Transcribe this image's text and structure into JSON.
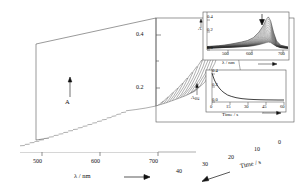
{
  "figure": {
    "kind": "3d-waterfall-absorption-spectra"
  },
  "main_plot": {
    "x_axis": {
      "label": "λ / nm",
      "label_arrow": "⟶",
      "ticks": [
        "500",
        "600",
        "700"
      ],
      "tick_values": [
        500,
        600,
        700
      ],
      "range": [
        460,
        740
      ]
    },
    "y_axis": {
      "label": "A",
      "label_arrow": "↑",
      "ticks": [
        "0.4",
        "0.2"
      ],
      "tick_values": [
        0.4,
        0.2
      ],
      "range": [
        0.0,
        0.47
      ]
    },
    "z_axis": {
      "label": "Time / s",
      "label_arrow": "⟵",
      "ticks": [
        "0",
        "10",
        "20",
        "30",
        "40"
      ],
      "tick_values": [
        0,
        10,
        20,
        30,
        40
      ],
      "range": [
        0,
        44
      ]
    }
  },
  "inset_top": {
    "name": "overlaid-spectra-inset",
    "x_axis": {
      "label": "λ / nm",
      "label_arrow": "⟶",
      "ticks": [
        "500",
        "600",
        "700"
      ],
      "tick_values": [
        500,
        600,
        700
      ]
    },
    "y_axis": {
      "label": "A",
      "ticks": [
        "0.4",
        "0.2",
        "0.0"
      ],
      "tick_values": [
        0.4,
        0.2,
        0.0
      ]
    },
    "annotation": {
      "marker": "down-arrow",
      "at_nm": 672,
      "meaning": "decay direction"
    }
  },
  "inset_bottom": {
    "name": "kinetic-decay-inset",
    "x_axis": {
      "label": "Time / s",
      "label_arrow": "⟶",
      "ticks": [
        "0",
        "15",
        "30",
        "45",
        "60"
      ],
      "tick_values": [
        0,
        15,
        30,
        45,
        60
      ]
    },
    "y_axis": {
      "label_base": "A",
      "label_sub": "604",
      "label_arrow": "↑",
      "ticks": [
        "0.4",
        "0.2",
        "0.0"
      ],
      "tick_values": [
        0.4,
        0.2,
        0.0
      ]
    }
  },
  "colors": {
    "ink": "#1a1a1a",
    "trace": "#333333",
    "axis": "#555555",
    "background": "#ffffff"
  },
  "chart_data": {
    "type": "line",
    "title": "",
    "xlabel": "λ / nm",
    "ylabel": "A",
    "zlabel": "Time / s",
    "xlim": [
      460,
      740
    ],
    "ylim": [
      0.0,
      0.47
    ],
    "zlim": [
      0,
      44
    ],
    "grid": false,
    "legend": "none",
    "x": [
      460,
      480,
      500,
      520,
      540,
      560,
      580,
      600,
      620,
      640,
      655,
      665,
      672,
      680,
      690,
      700,
      715,
      740
    ],
    "series": [
      {
        "name": "t = 0 s",
        "time_s": 0,
        "values": [
          0.045,
          0.05,
          0.056,
          0.064,
          0.076,
          0.09,
          0.105,
          0.124,
          0.16,
          0.235,
          0.32,
          0.4,
          0.432,
          0.38,
          0.23,
          0.12,
          0.062,
          0.04
        ]
      },
      {
        "name": "t = 2 s",
        "time_s": 2,
        "values": [
          0.043,
          0.048,
          0.054,
          0.061,
          0.072,
          0.085,
          0.099,
          0.117,
          0.15,
          0.22,
          0.3,
          0.374,
          0.404,
          0.356,
          0.216,
          0.113,
          0.059,
          0.038
        ]
      },
      {
        "name": "t = 4 s",
        "time_s": 4,
        "values": [
          0.041,
          0.046,
          0.051,
          0.058,
          0.068,
          0.08,
          0.093,
          0.11,
          0.141,
          0.205,
          0.28,
          0.349,
          0.377,
          0.333,
          0.203,
          0.107,
          0.056,
          0.036
        ]
      },
      {
        "name": "t = 6 s",
        "time_s": 6,
        "values": [
          0.039,
          0.044,
          0.049,
          0.055,
          0.065,
          0.076,
          0.088,
          0.103,
          0.132,
          0.192,
          0.261,
          0.325,
          0.351,
          0.311,
          0.19,
          0.101,
          0.053,
          0.035
        ]
      },
      {
        "name": "t = 8 s",
        "time_s": 8,
        "values": [
          0.038,
          0.042,
          0.047,
          0.053,
          0.062,
          0.072,
          0.083,
          0.097,
          0.124,
          0.179,
          0.243,
          0.302,
          0.326,
          0.29,
          0.178,
          0.096,
          0.051,
          0.034
        ]
      },
      {
        "name": "t = 10 s",
        "time_s": 10,
        "values": [
          0.036,
          0.04,
          0.045,
          0.05,
          0.059,
          0.068,
          0.078,
          0.092,
          0.117,
          0.168,
          0.226,
          0.28,
          0.303,
          0.27,
          0.167,
          0.091,
          0.049,
          0.033
        ]
      },
      {
        "name": "t = 12 s",
        "time_s": 12,
        "values": [
          0.035,
          0.039,
          0.043,
          0.048,
          0.056,
          0.065,
          0.074,
          0.087,
          0.11,
          0.157,
          0.211,
          0.26,
          0.281,
          0.251,
          0.157,
          0.086,
          0.047,
          0.032
        ]
      },
      {
        "name": "t = 14 s",
        "time_s": 14,
        "values": [
          0.034,
          0.037,
          0.041,
          0.046,
          0.053,
          0.062,
          0.07,
          0.082,
          0.104,
          0.147,
          0.197,
          0.242,
          0.261,
          0.234,
          0.147,
          0.082,
          0.045,
          0.031
        ]
      },
      {
        "name": "t = 16 s",
        "time_s": 16,
        "values": [
          0.033,
          0.036,
          0.04,
          0.045,
          0.051,
          0.059,
          0.067,
          0.078,
          0.098,
          0.138,
          0.184,
          0.225,
          0.243,
          0.218,
          0.138,
          0.078,
          0.043,
          0.03
        ]
      },
      {
        "name": "t = 18 s",
        "time_s": 18,
        "values": [
          0.032,
          0.035,
          0.039,
          0.043,
          0.049,
          0.057,
          0.064,
          0.074,
          0.093,
          0.13,
          0.172,
          0.209,
          0.226,
          0.204,
          0.13,
          0.074,
          0.042,
          0.029
        ]
      },
      {
        "name": "t = 20 s",
        "time_s": 20,
        "values": [
          0.031,
          0.034,
          0.037,
          0.042,
          0.048,
          0.054,
          0.061,
          0.07,
          0.088,
          0.122,
          0.161,
          0.195,
          0.21,
          0.19,
          0.123,
          0.071,
          0.04,
          0.028
        ]
      },
      {
        "name": "t = 22 s",
        "time_s": 22,
        "values": [
          0.03,
          0.033,
          0.036,
          0.04,
          0.046,
          0.052,
          0.059,
          0.067,
          0.084,
          0.115,
          0.151,
          0.182,
          0.196,
          0.178,
          0.116,
          0.068,
          0.039,
          0.028
        ]
      },
      {
        "name": "t = 24 s",
        "time_s": 24,
        "values": [
          0.03,
          0.032,
          0.035,
          0.039,
          0.044,
          0.05,
          0.056,
          0.064,
          0.08,
          0.109,
          0.142,
          0.17,
          0.183,
          0.167,
          0.11,
          0.065,
          0.038,
          0.027
        ]
      },
      {
        "name": "t = 26 s",
        "time_s": 26,
        "values": [
          0.029,
          0.031,
          0.034,
          0.038,
          0.043,
          0.049,
          0.054,
          0.062,
          0.076,
          0.103,
          0.133,
          0.159,
          0.171,
          0.156,
          0.104,
          0.063,
          0.037,
          0.027
        ]
      },
      {
        "name": "t = 28 s",
        "time_s": 28,
        "values": [
          0.028,
          0.031,
          0.034,
          0.037,
          0.042,
          0.047,
          0.052,
          0.059,
          0.073,
          0.098,
          0.126,
          0.149,
          0.16,
          0.147,
          0.099,
          0.06,
          0.036,
          0.026
        ]
      },
      {
        "name": "t = 30 s",
        "time_s": 30,
        "values": [
          0.028,
          0.03,
          0.033,
          0.036,
          0.04,
          0.045,
          0.051,
          0.057,
          0.07,
          0.093,
          0.119,
          0.14,
          0.15,
          0.138,
          0.094,
          0.058,
          0.035,
          0.026
        ]
      },
      {
        "name": "t = 32 s",
        "time_s": 32,
        "values": [
          0.027,
          0.03,
          0.032,
          0.035,
          0.039,
          0.044,
          0.049,
          0.055,
          0.067,
          0.089,
          0.112,
          0.131,
          0.141,
          0.13,
          0.09,
          0.056,
          0.034,
          0.025
        ]
      },
      {
        "name": "t = 34 s",
        "time_s": 34,
        "values": [
          0.027,
          0.029,
          0.031,
          0.034,
          0.038,
          0.043,
          0.047,
          0.053,
          0.065,
          0.085,
          0.107,
          0.124,
          0.133,
          0.123,
          0.086,
          0.054,
          0.034,
          0.025
        ]
      },
      {
        "name": "t = 36 s",
        "time_s": 36,
        "values": [
          0.026,
          0.029,
          0.031,
          0.034,
          0.037,
          0.042,
          0.046,
          0.052,
          0.063,
          0.081,
          0.101,
          0.117,
          0.125,
          0.116,
          0.082,
          0.053,
          0.033,
          0.025
        ]
      },
      {
        "name": "t = 38 s",
        "time_s": 38,
        "values": [
          0.026,
          0.028,
          0.03,
          0.033,
          0.037,
          0.041,
          0.045,
          0.05,
          0.06,
          0.078,
          0.096,
          0.111,
          0.118,
          0.11,
          0.079,
          0.051,
          0.032,
          0.024
        ]
      },
      {
        "name": "t = 40 s",
        "time_s": 40,
        "values": [
          0.026,
          0.028,
          0.03,
          0.033,
          0.036,
          0.04,
          0.044,
          0.049,
          0.059,
          0.075,
          0.092,
          0.105,
          0.112,
          0.105,
          0.076,
          0.05,
          0.032,
          0.024
        ]
      },
      {
        "name": "t = 42 s",
        "time_s": 42,
        "values": [
          0.025,
          0.027,
          0.029,
          0.032,
          0.035,
          0.039,
          0.043,
          0.048,
          0.057,
          0.072,
          0.088,
          0.1,
          0.107,
          0.1,
          0.074,
          0.049,
          0.031,
          0.024
        ]
      },
      {
        "name": "t = 44 s",
        "time_s": 44,
        "values": [
          0.025,
          0.027,
          0.029,
          0.032,
          0.035,
          0.038,
          0.042,
          0.047,
          0.055,
          0.07,
          0.085,
          0.096,
          0.102,
          0.096,
          0.071,
          0.048,
          0.031,
          0.024
        ]
      }
    ],
    "kinetic_trace": {
      "name": "A604 decay",
      "xlabel": "Time / s",
      "ylabel": "A604",
      "xlim": [
        0,
        60
      ],
      "ylim": [
        0.0,
        0.45
      ],
      "t": [
        0,
        2,
        4,
        6,
        8,
        10,
        13,
        16,
        20,
        25,
        30,
        35,
        40,
        45,
        50,
        55,
        60
      ],
      "values": [
        0.43,
        0.33,
        0.26,
        0.21,
        0.17,
        0.14,
        0.105,
        0.085,
        0.065,
        0.05,
        0.042,
        0.037,
        0.034,
        0.032,
        0.031,
        0.03,
        0.03
      ]
    }
  }
}
